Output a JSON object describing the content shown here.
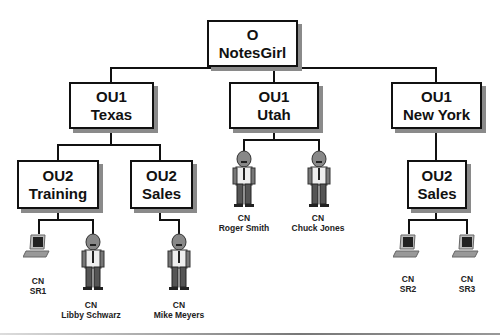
{
  "diagram": {
    "root": {
      "type": "O",
      "name": "NotesGirl"
    },
    "ou1": [
      {
        "type": "OU1",
        "name": "Texas"
      },
      {
        "type": "OU1",
        "name": "Utah"
      },
      {
        "type": "OU1",
        "name": "New York"
      }
    ],
    "ou2": [
      {
        "type": "OU2",
        "name": "Training",
        "parent": "Texas"
      },
      {
        "type": "OU2",
        "name": "Sales",
        "parent": "Texas"
      },
      {
        "type": "OU2",
        "name": "Sales",
        "parent": "New York"
      }
    ],
    "leaves": [
      {
        "type": "CN",
        "name": "SR1",
        "icon": "computer-icon",
        "parent": "Training"
      },
      {
        "type": "CN",
        "name": "Libby Schwarz",
        "icon": "person-icon",
        "parent": "Training"
      },
      {
        "type": "CN",
        "name": "Mike Meyers",
        "icon": "person-icon",
        "parent": "Sales"
      },
      {
        "type": "CN",
        "name": "Roger Smith",
        "icon": "person-icon",
        "parent": "Utah"
      },
      {
        "type": "CN",
        "name": "Chuck Jones",
        "icon": "person-icon",
        "parent": "Utah"
      },
      {
        "type": "CN",
        "name": "SR2",
        "icon": "computer-icon",
        "parent": "Sales (New York)"
      },
      {
        "type": "CN",
        "name": "SR3",
        "icon": "computer-icon",
        "parent": "Sales (New York)"
      }
    ]
  },
  "colors": {
    "line": "#111111",
    "shadow": "#8a8a8a",
    "background": "#ffffff"
  }
}
